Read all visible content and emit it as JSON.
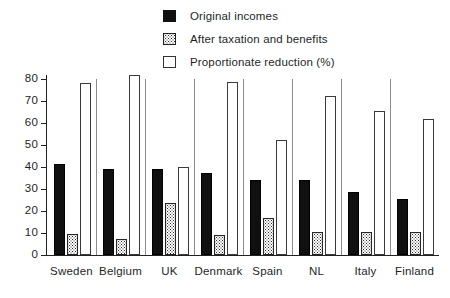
{
  "chart_data": {
    "type": "bar",
    "title": "",
    "xlabel": "",
    "ylabel": "",
    "ylim": [
      0,
      80
    ],
    "yticks": [
      0,
      10,
      20,
      30,
      40,
      50,
      60,
      70,
      80
    ],
    "grid": false,
    "legend_position": "top-center",
    "categories": [
      "Sweden",
      "Belgium",
      "UK",
      "Denmark",
      "Spain",
      "NL",
      "Italy",
      "Finland"
    ],
    "series": [
      {
        "name": "Original incomes",
        "style": "solid-black",
        "values": [
          41.5,
          39,
          39,
          37.5,
          34,
          34,
          28.5,
          25.5
        ]
      },
      {
        "name": "After taxation and benefits",
        "style": "stippled",
        "values": [
          9.5,
          7.5,
          23.5,
          9,
          17,
          10.5,
          10.5,
          10.5
        ]
      },
      {
        "name": "Proportionate reduction (%)",
        "style": "open-outline",
        "values": [
          78,
          82,
          40,
          78.5,
          52.5,
          72.5,
          65.5,
          62
        ]
      }
    ]
  },
  "legend": {
    "items": [
      {
        "label": "Original incomes",
        "swatch": "solid-black-swatch"
      },
      {
        "label": "After taxation and benefits",
        "swatch": "stippled-swatch"
      },
      {
        "label": "Proportionate reduction (%)",
        "swatch": "open-outline-swatch"
      }
    ]
  },
  "axis": {
    "y_tick_labels": [
      "80",
      "70",
      "60",
      "50",
      "40",
      "30",
      "20",
      "10",
      "0"
    ]
  },
  "colors": {
    "series_solid": "#101010",
    "series_stippled_border": "#262626",
    "series_open_border": "#3a3a3a",
    "axis": "#222222",
    "separator": "#8c8c8c",
    "background": "#ffffff",
    "text": "#1f1f1f"
  }
}
